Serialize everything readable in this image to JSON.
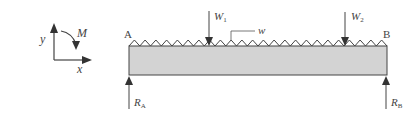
{
  "diagram": {
    "type": "simply-supported-beam",
    "coordinate_system": {
      "y_label": "y",
      "x_label": "x",
      "moment_label": "M"
    },
    "beam": {
      "left_end_label": "A",
      "right_end_label": "B",
      "fill_color": "#d3d3d3",
      "outline_color": "#444444"
    },
    "loads": {
      "point_load_1": {
        "label": "W",
        "subscript": "1"
      },
      "point_load_2": {
        "label": "W",
        "subscript": "2"
      },
      "distributed_load": {
        "label": "w"
      }
    },
    "reactions": {
      "left": {
        "label": "R",
        "subscript": "A"
      },
      "right": {
        "label": "R",
        "subscript": "B"
      }
    }
  }
}
